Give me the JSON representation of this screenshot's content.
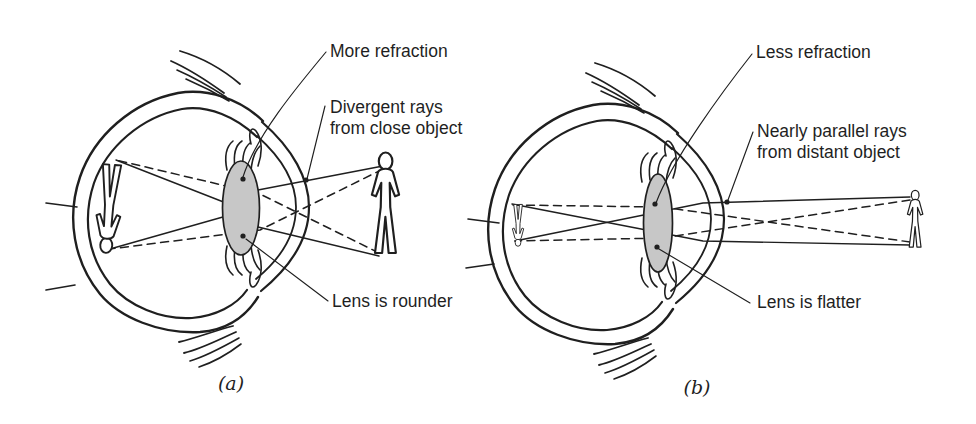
{
  "colors": {
    "ink": "#1f1f1f",
    "lens_fill": "#c7c7c7",
    "background": "#ffffff"
  },
  "panels": [
    {
      "caption": "(a)",
      "labels": {
        "refraction": "More refraction",
        "rays_line1": "Divergent rays",
        "rays_line2": "from close object",
        "lens": "Lens is rounder"
      }
    },
    {
      "caption": "(b)",
      "labels": {
        "refraction": "Less refraction",
        "rays_line1": "Nearly parallel rays",
        "rays_line2": "from distant object",
        "lens": "Lens is flatter"
      }
    }
  ]
}
